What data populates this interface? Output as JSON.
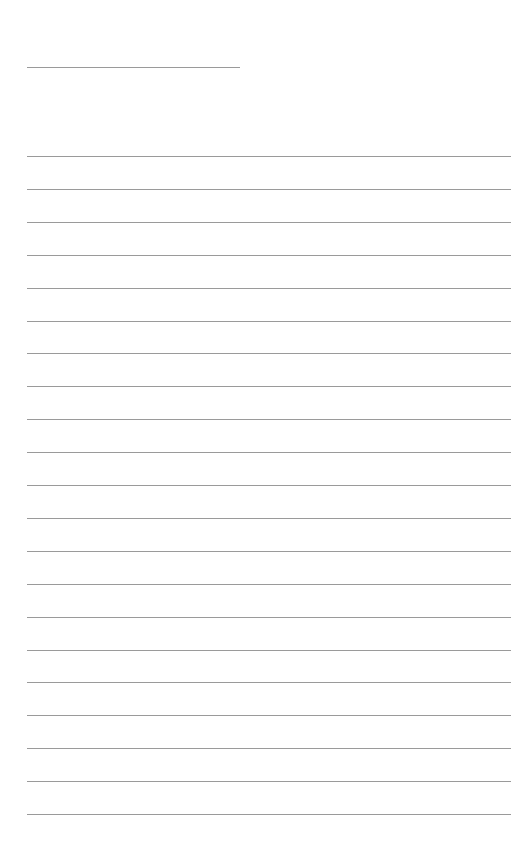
{
  "page": {
    "type": "blank lined paper",
    "line_color": "#9a9a9a",
    "background": "#ffffff",
    "header_line": {
      "x": 27,
      "y": 67,
      "width": 213
    },
    "ruled_lines": {
      "x": 27,
      "width": 484,
      "start_y": 156,
      "spacing": 32.9,
      "count": 21
    }
  }
}
